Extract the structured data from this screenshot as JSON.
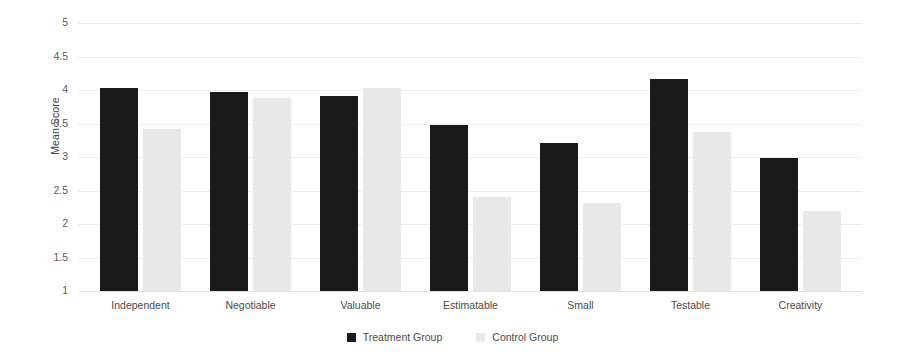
{
  "chart_data": {
    "type": "bar",
    "title": "",
    "xlabel": "",
    "ylabel": "Mean Score",
    "ylim": [
      1,
      5
    ],
    "ytick_step": 0.5,
    "ytick_labels": [
      "5",
      "4.5",
      "4",
      "3.5",
      "3",
      "2.5",
      "2",
      "1.5",
      "1"
    ],
    "grid": true,
    "legend_position": "bottom-center",
    "categories": [
      "Independent",
      "Negotiable",
      "Valuable",
      "Estimatable",
      "Small",
      "Testable",
      "Creativity"
    ],
    "series": [
      {
        "name": "Treatment Group",
        "color": "#1a1a1a",
        "values": [
          4.03,
          3.97,
          3.91,
          3.48,
          3.21,
          4.16,
          2.99
        ]
      },
      {
        "name": "Control Group",
        "color": "#e8e8e8",
        "values": [
          3.42,
          3.88,
          4.03,
          2.4,
          2.32,
          3.37,
          2.2
        ]
      }
    ]
  },
  "colors": {
    "treatment": "#1a1a1a",
    "control": "#e8e8e8",
    "gridline": "#ececec",
    "background": "#ffffff",
    "text": "#4a4a4a"
  }
}
